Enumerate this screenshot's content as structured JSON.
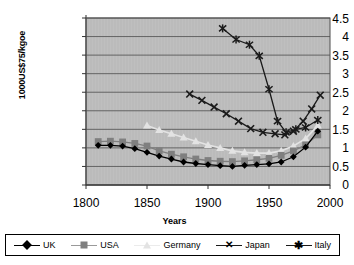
{
  "chart_data": {
    "type": "line",
    "title": "",
    "xlabel": "Years",
    "ylabel": "1000US$75/kgoe",
    "xlim": [
      1800,
      2000
    ],
    "ylim": [
      0,
      4.5
    ],
    "grid": true,
    "legend_position": "bottom",
    "plot_background": "#bfbfbf",
    "x_ticks": [
      "1800",
      "1850",
      "1900",
      "1950",
      "2000"
    ],
    "y_ticks": [
      "0",
      "0.5",
      "1",
      "1.5",
      "2",
      "2.5",
      "3",
      "3.5",
      "4",
      "4.5"
    ],
    "series": [
      {
        "name": "UK",
        "color": "#000000",
        "marker": "diamond",
        "points": [
          [
            1810,
            1.07
          ],
          [
            1820,
            1.07
          ],
          [
            1830,
            1.05
          ],
          [
            1840,
            0.98
          ],
          [
            1850,
            0.88
          ],
          [
            1860,
            0.78
          ],
          [
            1870,
            0.7
          ],
          [
            1880,
            0.62
          ],
          [
            1890,
            0.58
          ],
          [
            1900,
            0.55
          ],
          [
            1910,
            0.52
          ],
          [
            1920,
            0.5
          ],
          [
            1930,
            0.53
          ],
          [
            1940,
            0.55
          ],
          [
            1950,
            0.57
          ],
          [
            1960,
            0.62
          ],
          [
            1970,
            0.76
          ],
          [
            1980,
            1.02
          ],
          [
            1990,
            1.45
          ]
        ]
      },
      {
        "name": "USA",
        "color": "#7f7f7f",
        "marker": "square",
        "points": [
          [
            1810,
            1.17
          ],
          [
            1820,
            1.18
          ],
          [
            1830,
            1.16
          ],
          [
            1840,
            1.12
          ],
          [
            1850,
            1.05
          ],
          [
            1860,
            0.92
          ],
          [
            1870,
            0.83
          ],
          [
            1880,
            0.76
          ],
          [
            1890,
            0.7
          ],
          [
            1900,
            0.66
          ],
          [
            1910,
            0.64
          ],
          [
            1920,
            0.63
          ],
          [
            1930,
            0.65
          ],
          [
            1940,
            0.68
          ],
          [
            1950,
            0.72
          ],
          [
            1960,
            0.8
          ],
          [
            1970,
            0.92
          ],
          [
            1980,
            1.08
          ],
          [
            1990,
            1.35
          ]
        ]
      },
      {
        "name": "Germany",
        "color": "#e3e3e3",
        "marker": "triangle",
        "points": [
          [
            1850,
            1.6
          ],
          [
            1860,
            1.48
          ],
          [
            1870,
            1.38
          ],
          [
            1880,
            1.28
          ],
          [
            1890,
            1.18
          ],
          [
            1900,
            1.08
          ],
          [
            1910,
            1.0
          ],
          [
            1920,
            0.92
          ],
          [
            1930,
            0.88
          ],
          [
            1940,
            0.86
          ],
          [
            1950,
            0.86
          ],
          [
            1960,
            0.92
          ],
          [
            1970,
            1.05
          ],
          [
            1980,
            1.25
          ],
          [
            1990,
            1.6
          ]
        ]
      },
      {
        "name": "Japan",
        "color": "#1a1a1a",
        "marker": "cross",
        "points": [
          [
            1885,
            2.45
          ],
          [
            1895,
            2.28
          ],
          [
            1905,
            2.1
          ],
          [
            1915,
            1.92
          ],
          [
            1925,
            1.72
          ],
          [
            1935,
            1.52
          ],
          [
            1945,
            1.42
          ],
          [
            1955,
            1.38
          ],
          [
            1963,
            1.35
          ],
          [
            1970,
            1.45
          ],
          [
            1978,
            1.72
          ],
          [
            1985,
            2.05
          ],
          [
            1992,
            2.42
          ]
        ]
      },
      {
        "name": "Italy",
        "color": "#1a1a1a",
        "marker": "star",
        "points": [
          [
            1912,
            4.22
          ],
          [
            1923,
            3.92
          ],
          [
            1934,
            3.78
          ],
          [
            1942,
            3.48
          ],
          [
            1950,
            2.58
          ],
          [
            1957,
            1.72
          ],
          [
            1964,
            1.42
          ],
          [
            1972,
            1.5
          ],
          [
            1980,
            1.55
          ],
          [
            1990,
            1.75
          ]
        ]
      }
    ]
  },
  "legend": {
    "items": [
      {
        "label": "UK"
      },
      {
        "label": "USA"
      },
      {
        "label": "Germany"
      },
      {
        "label": "Japan"
      },
      {
        "label": "Italy"
      }
    ]
  }
}
